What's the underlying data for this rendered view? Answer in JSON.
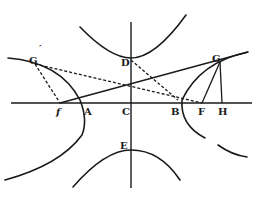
{
  "figure": {
    "type": "geometric-diagram",
    "labels": {
      "G_prime": "G",
      "G_prime_mark": "′",
      "G": "G",
      "D": "D",
      "f": "f",
      "A": "A",
      "C": "C",
      "B": "B",
      "F": "F",
      "H": "H",
      "E": "E"
    },
    "colors": {
      "ink": "#1a1a1a",
      "background": "#ffffff"
    }
  }
}
